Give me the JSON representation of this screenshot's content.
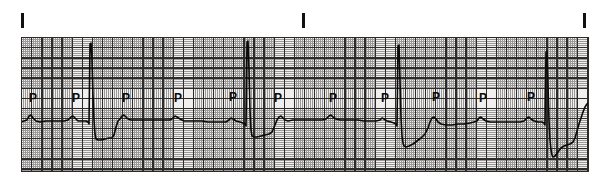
{
  "figure": {
    "width": 603,
    "height": 191,
    "background_color": "#ffffff"
  },
  "paper": {
    "name": "ecg-grid-paper",
    "x": 21,
    "y": 37,
    "width": 568,
    "height": 135,
    "background_color": "#f2f0ef",
    "fine_grid_color": "#8d8a88",
    "bold_grid_color": "#2b2b2b",
    "border_color": "#2a2a2a",
    "fine_pitch_px": 2.02,
    "bold_pitch_px": 10.1
  },
  "tick_marks": {
    "color": "#111111",
    "label": "lead/time calibration ticks",
    "items": [
      {
        "x": 21,
        "y": 13,
        "height": 15
      },
      {
        "x": 302,
        "y": 13,
        "height": 15
      },
      {
        "x": 583,
        "y": 13,
        "height": 15
      }
    ]
  },
  "annotations": {
    "letter": "P",
    "color": "#0a0a0a",
    "font_size_px": 12,
    "positions": [
      {
        "x": 29,
        "y": 92
      },
      {
        "x": 72,
        "y": 92
      },
      {
        "x": 122,
        "y": 92
      },
      {
        "x": 174,
        "y": 92
      },
      {
        "x": 229,
        "y": 91
      },
      {
        "x": 274,
        "y": 92
      },
      {
        "x": 329,
        "y": 92
      },
      {
        "x": 381,
        "y": 92
      },
      {
        "x": 432,
        "y": 91
      },
      {
        "x": 479,
        "y": 92
      },
      {
        "x": 527,
        "y": 91
      }
    ]
  },
  "chart_data": {
    "type": "line",
    "xlabel": "",
    "ylabel": "",
    "grid": true,
    "legend": false,
    "axis_hidden": true,
    "xlim": [
      21,
      589
    ],
    "ylim": [
      37,
      172
    ],
    "baseline_y": 121,
    "trace_color": "#0a0a0a",
    "series": [
      {
        "name": "ecg-lead-trace",
        "description": "Sinus-rhythm-like ECG trace: low-amplitude P waves followed by narrow tall R spikes with deep S depressions; 4 QRS complexes across the strip.",
        "points": [
          [
            21,
            122
          ],
          [
            24,
            121
          ],
          [
            27,
            120
          ],
          [
            29,
            116
          ],
          [
            31,
            115
          ],
          [
            33,
            118
          ],
          [
            36,
            121
          ],
          [
            40,
            122
          ],
          [
            46,
            121
          ],
          [
            52,
            121
          ],
          [
            58,
            121
          ],
          [
            64,
            121
          ],
          [
            68,
            120
          ],
          [
            71,
            117
          ],
          [
            73,
            116
          ],
          [
            75,
            118
          ],
          [
            78,
            121
          ],
          [
            82,
            121
          ],
          [
            86,
            121
          ],
          [
            88,
            122
          ],
          [
            89,
            124
          ],
          [
            90,
            44
          ],
          [
            91,
            43
          ],
          [
            92,
            60
          ],
          [
            93,
            95
          ],
          [
            94,
            120
          ],
          [
            95,
            134
          ],
          [
            96,
            139
          ],
          [
            98,
            140
          ],
          [
            101,
            140
          ],
          [
            105,
            139
          ],
          [
            109,
            138
          ],
          [
            112,
            138
          ],
          [
            114,
            135
          ],
          [
            116,
            127
          ],
          [
            118,
            121
          ],
          [
            120,
            119
          ],
          [
            122,
            116
          ],
          [
            124,
            115
          ],
          [
            126,
            117
          ],
          [
            128,
            119
          ],
          [
            131,
            120
          ],
          [
            136,
            120
          ],
          [
            142,
            120
          ],
          [
            148,
            120
          ],
          [
            154,
            120
          ],
          [
            160,
            120
          ],
          [
            166,
            120
          ],
          [
            170,
            120
          ],
          [
            173,
            118
          ],
          [
            175,
            116
          ],
          [
            177,
            117
          ],
          [
            180,
            119
          ],
          [
            184,
            121
          ],
          [
            190,
            121
          ],
          [
            196,
            121
          ],
          [
            202,
            121
          ],
          [
            208,
            122
          ],
          [
            214,
            122
          ],
          [
            220,
            122
          ],
          [
            226,
            122
          ],
          [
            229,
            120
          ],
          [
            231,
            118
          ],
          [
            233,
            119
          ],
          [
            236,
            121
          ],
          [
            240,
            122
          ],
          [
            243,
            123
          ],
          [
            245,
            124
          ],
          [
            246,
            126
          ],
          [
            247,
            42
          ],
          [
            248,
            41
          ],
          [
            249,
            70
          ],
          [
            250,
            110
          ],
          [
            251,
            130
          ],
          [
            252,
            136
          ],
          [
            254,
            137
          ],
          [
            257,
            137
          ],
          [
            261,
            136
          ],
          [
            265,
            135
          ],
          [
            269,
            134
          ],
          [
            272,
            132
          ],
          [
            275,
            125
          ],
          [
            277,
            120
          ],
          [
            279,
            117
          ],
          [
            281,
            116
          ],
          [
            283,
            118
          ],
          [
            285,
            120
          ],
          [
            288,
            121
          ],
          [
            293,
            120
          ],
          [
            299,
            120
          ],
          [
            305,
            120
          ],
          [
            311,
            120
          ],
          [
            317,
            120
          ],
          [
            322,
            120
          ],
          [
            326,
            119
          ],
          [
            329,
            116
          ],
          [
            331,
            115
          ],
          [
            333,
            117
          ],
          [
            336,
            119
          ],
          [
            340,
            120
          ],
          [
            346,
            120
          ],
          [
            352,
            120
          ],
          [
            358,
            120
          ],
          [
            364,
            121
          ],
          [
            370,
            121
          ],
          [
            376,
            121
          ],
          [
            380,
            120
          ],
          [
            382,
            118
          ],
          [
            384,
            119
          ],
          [
            387,
            121
          ],
          [
            391,
            122
          ],
          [
            394,
            123
          ],
          [
            396,
            124
          ],
          [
            397,
            126
          ],
          [
            398,
            46
          ],
          [
            399,
            45
          ],
          [
            400,
            80
          ],
          [
            401,
            118
          ],
          [
            402,
            136
          ],
          [
            403,
            143
          ],
          [
            404,
            146
          ],
          [
            406,
            147
          ],
          [
            409,
            146
          ],
          [
            413,
            144
          ],
          [
            417,
            141
          ],
          [
            421,
            138
          ],
          [
            425,
            134
          ],
          [
            428,
            128
          ],
          [
            430,
            122
          ],
          [
            432,
            118
          ],
          [
            434,
            117
          ],
          [
            436,
            119
          ],
          [
            438,
            122
          ],
          [
            441,
            124
          ],
          [
            446,
            125
          ],
          [
            452,
            125
          ],
          [
            458,
            124
          ],
          [
            464,
            124
          ],
          [
            470,
            123
          ],
          [
            474,
            122
          ],
          [
            477,
            121
          ],
          [
            479,
            118
          ],
          [
            481,
            117
          ],
          [
            483,
            119
          ],
          [
            486,
            121
          ],
          [
            490,
            122
          ],
          [
            496,
            122
          ],
          [
            502,
            122
          ],
          [
            508,
            122
          ],
          [
            514,
            122
          ],
          [
            520,
            122
          ],
          [
            524,
            121
          ],
          [
            527,
            118
          ],
          [
            529,
            117
          ],
          [
            531,
            119
          ],
          [
            534,
            121
          ],
          [
            538,
            122
          ],
          [
            542,
            122
          ],
          [
            544,
            123
          ],
          [
            545,
            125
          ],
          [
            546,
            52
          ],
          [
            547,
            51
          ],
          [
            548,
            85
          ],
          [
            549,
            120
          ],
          [
            550,
            140
          ],
          [
            551,
            150
          ],
          [
            552,
            155
          ],
          [
            553,
            157
          ],
          [
            555,
            156
          ],
          [
            558,
            152
          ],
          [
            561,
            148
          ],
          [
            564,
            146
          ],
          [
            567,
            145
          ],
          [
            570,
            144
          ],
          [
            573,
            142
          ],
          [
            575,
            138
          ],
          [
            577,
            131
          ],
          [
            579,
            124
          ],
          [
            581,
            118
          ],
          [
            583,
            112
          ],
          [
            585,
            107
          ],
          [
            587,
            104
          ],
          [
            589,
            102
          ]
        ]
      }
    ]
  }
}
